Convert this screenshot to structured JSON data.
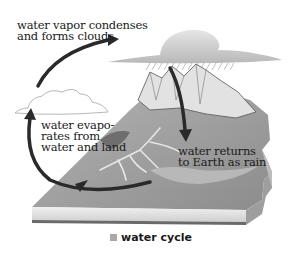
{
  "diagram": {
    "type": "process-cycle",
    "title": "water cycle",
    "colors": {
      "arrow": "#2a2a2a",
      "terrain": "#9a9a9a",
      "water_channels": "#e6e6e6",
      "slab_side": "#d8d8d8",
      "cloud": "#c4c4c4",
      "caption_marker": "#a8a8a8"
    },
    "labels": {
      "condense": "water vapor condenses\nand forms clouds",
      "evaporate": "water evapo-\nrates from\nwater and land",
      "rain": "water returns\nto Earth as rain"
    },
    "steps": [
      {
        "id": "evaporate",
        "text": "water evapo-rates from water and land"
      },
      {
        "id": "condense",
        "text": "water vapor condenses and forms clouds"
      },
      {
        "id": "rain",
        "text": "water returns to Earth as rain"
      }
    ],
    "arrows": [
      {
        "from": "evaporate",
        "to": "condense"
      },
      {
        "from": "condense",
        "to": "rain"
      },
      {
        "from": "rain",
        "to": "evaporate"
      }
    ]
  },
  "caption": {
    "text": "water cycle"
  }
}
